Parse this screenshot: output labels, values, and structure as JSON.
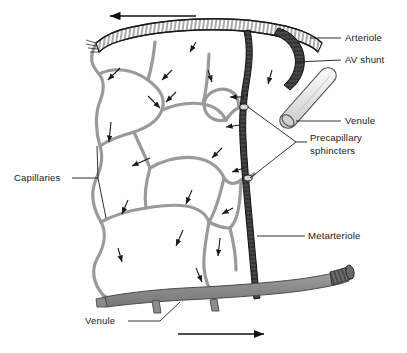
{
  "figure": {
    "background_color": "#ffffff",
    "width": 407,
    "height": 353
  },
  "colors": {
    "ink": "#1a1a1a",
    "capillary_stroke": "#9a9a9a",
    "capillary_fill": "#ffffff",
    "venule_fill": "#8c8c8c",
    "venule_stroke": "#4a4a4a",
    "shunt_tube_fill": "#e2e2e2",
    "shunt_tube_stroke": "#555555",
    "metarteriole_fill": "#3d3d3d",
    "arteriole_fill": "#ffffff",
    "leader_line": "#1a1a1a"
  },
  "labels": [
    {
      "id": "arteriole",
      "text": "Arteriole",
      "x": 345,
      "y": 41,
      "anchor": "start"
    },
    {
      "id": "av-shunt",
      "text": "AV shunt",
      "x": 345,
      "y": 63,
      "anchor": "start"
    },
    {
      "id": "venule-right",
      "text": "Venule",
      "x": 345,
      "y": 124,
      "anchor": "start"
    },
    {
      "id": "capillaries",
      "text": "Capillaries",
      "x": 14,
      "y": 181,
      "anchor": "start"
    },
    {
      "id": "metarteriole",
      "text": "Metarteriole",
      "x": 308,
      "y": 239,
      "anchor": "start"
    },
    {
      "id": "venule-bottom",
      "text": "Venule",
      "x": 85,
      "y": 324,
      "anchor": "start"
    }
  ],
  "multiline_labels": [
    {
      "id": "precapillary-sphincters",
      "lines": [
        "Precapillary",
        "sphincters"
      ],
      "x": 310,
      "y": 147,
      "line_height": 13
    }
  ],
  "flow_arrows": [
    {
      "id": "top-flow-arrow",
      "direction": "left",
      "x1": 196,
      "y1": 16,
      "x2": 108,
      "y2": 16
    },
    {
      "id": "bottom-flow-arrow",
      "direction": "right",
      "x1": 178,
      "y1": 334,
      "x2": 266,
      "y2": 334
    }
  ],
  "vessels": [
    {
      "id": "arteriole-vessel",
      "name": "Arteriole",
      "style": "hatched-thick-band",
      "orientation": "horizontal-top"
    },
    {
      "id": "av-shunt-vessel",
      "name": "AV shunt",
      "style": "dark-curved-tube",
      "orientation": "curve-right"
    },
    {
      "id": "venule-tube",
      "name": "Venule",
      "style": "light-gray-cylinder",
      "orientation": "diagonal"
    },
    {
      "id": "metarteriole-vessel",
      "name": "Metarteriole",
      "style": "dark-textured-vertical",
      "orientation": "vertical"
    },
    {
      "id": "venule-bottom-vessel",
      "name": "Venule",
      "style": "gray-thick-band",
      "orientation": "horizontal-bottom"
    },
    {
      "id": "capillary-network",
      "name": "Capillaries",
      "style": "thin-outlined-loops",
      "orientation": "network"
    },
    {
      "id": "sphincter-upper",
      "name": "Precapillary sphincter",
      "style": "constriction",
      "orientation": "junction"
    },
    {
      "id": "sphincter-lower",
      "name": "Precapillary sphincter",
      "style": "constriction",
      "orientation": "junction"
    }
  ]
}
